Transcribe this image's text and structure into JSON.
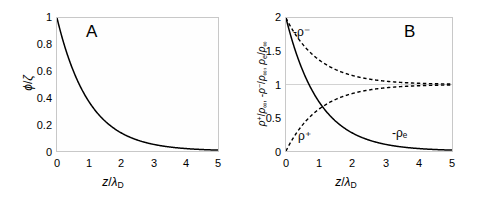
{
  "figure": {
    "panels": [
      {
        "letter": "A",
        "xlabel": "z/λ_D",
        "ylabel": "φ/ζ"
      },
      {
        "letter": "B",
        "xlabel": "z/λ_D",
        "ylabel": "ρ⁺/ρ∞, -ρ⁻/ρ∞, ρₑ/ρ∞"
      }
    ]
  },
  "chart_data": [
    {
      "type": "line",
      "title": "A",
      "xlabel": "z/λ_D",
      "ylabel": "φ/ζ",
      "xlim": [
        0,
        5
      ],
      "ylim": [
        0,
        1
      ],
      "xticks": [
        "0",
        "1",
        "2",
        "3",
        "4",
        "5"
      ],
      "xtick_values": [
        0,
        1,
        2,
        3,
        4,
        5
      ],
      "yticks": [
        "0",
        "0.2",
        "0.4",
        "0.6",
        "0.8",
        "1"
      ],
      "ytick_values": [
        0,
        0.2,
        0.4,
        0.6,
        0.8,
        1
      ],
      "grid": false,
      "legend": "none",
      "series": [
        {
          "name": "φ/ζ",
          "style": "solid",
          "color": "#000000",
          "formula": "exp(-x)",
          "x": [
            0,
            0.25,
            0.5,
            0.75,
            1,
            1.25,
            1.5,
            1.75,
            2,
            2.5,
            3,
            3.5,
            4,
            4.5,
            5
          ],
          "values": [
            1,
            0.779,
            0.607,
            0.472,
            0.368,
            0.287,
            0.223,
            0.174,
            0.135,
            0.082,
            0.05,
            0.03,
            0.018,
            0.011,
            0.007
          ]
        }
      ]
    },
    {
      "type": "line",
      "title": "B",
      "xlabel": "z/λ_D",
      "ylabel": "ρ⁺/ρ∞, -ρ⁻/ρ∞, ρₑ/ρ∞",
      "xlim": [
        0,
        5
      ],
      "ylim": [
        0,
        2
      ],
      "xticks": [
        "0",
        "1",
        "2",
        "3",
        "4",
        "5"
      ],
      "xtick_values": [
        0,
        1,
        2,
        3,
        4,
        5
      ],
      "yticks": [
        "0",
        "0.5",
        "1",
        "1.5",
        "2"
      ],
      "ytick_values": [
        0,
        0.5,
        1,
        1.5,
        2
      ],
      "grid": true,
      "gridlines_y": [
        1
      ],
      "legend": "inline-annotations",
      "series": [
        {
          "name": "-ρ⁻",
          "label": "-ρ⁻",
          "style": "dashed",
          "color": "#000000",
          "formula": "1 + exp(-x)",
          "x": [
            0,
            0.25,
            0.5,
            0.75,
            1,
            1.25,
            1.5,
            1.75,
            2,
            2.5,
            3,
            3.5,
            4,
            4.5,
            5
          ],
          "values": [
            2,
            1.779,
            1.607,
            1.472,
            1.368,
            1.287,
            1.223,
            1.174,
            1.135,
            1.082,
            1.05,
            1.03,
            1.018,
            1.011,
            1.007
          ]
        },
        {
          "name": "ρ⁺",
          "label": "ρ⁺",
          "style": "dashed",
          "color": "#000000",
          "formula": "1 - exp(-x)",
          "x": [
            0,
            0.25,
            0.5,
            0.75,
            1,
            1.25,
            1.5,
            1.75,
            2,
            2.5,
            3,
            3.5,
            4,
            4.5,
            5
          ],
          "values": [
            0,
            0.221,
            0.393,
            0.528,
            0.632,
            0.713,
            0.777,
            0.826,
            0.865,
            0.918,
            0.95,
            0.97,
            0.982,
            0.989,
            0.993
          ]
        },
        {
          "name": "-ρₑ",
          "label": "-ρₑ",
          "style": "solid",
          "color": "#000000",
          "formula": "2*exp(-x)",
          "x": [
            0,
            0.25,
            0.5,
            0.75,
            1,
            1.25,
            1.5,
            1.75,
            2,
            2.5,
            3,
            3.5,
            4,
            4.5,
            5
          ],
          "values": [
            2,
            1.558,
            1.213,
            0.945,
            0.736,
            0.573,
            0.446,
            0.347,
            0.271,
            0.164,
            0.1,
            0.06,
            0.037,
            0.022,
            0.013
          ]
        }
      ]
    }
  ],
  "panel_a": {
    "letter": "A",
    "yticks": [
      {
        "label": "1"
      },
      {
        "label": "0.8"
      },
      {
        "label": "0.6"
      },
      {
        "label": "0.4"
      },
      {
        "label": "0.2"
      },
      {
        "label": "0"
      }
    ],
    "xticks": [
      {
        "label": "0"
      },
      {
        "label": "1"
      },
      {
        "label": "2"
      },
      {
        "label": "3"
      },
      {
        "label": "4"
      },
      {
        "label": "5"
      }
    ]
  },
  "panel_b": {
    "letter": "B",
    "yticks": [
      {
        "label": "2"
      },
      {
        "label": "1.5"
      },
      {
        "label": "1"
      },
      {
        "label": "0.5"
      },
      {
        "label": "0"
      }
    ],
    "xticks": [
      {
        "label": "0"
      },
      {
        "label": "1"
      },
      {
        "label": "2"
      },
      {
        "label": "3"
      },
      {
        "label": "4"
      },
      {
        "label": "5"
      }
    ],
    "annotations": [
      {
        "text": "-ρ⁻"
      },
      {
        "text": "ρ⁺"
      },
      {
        "text": "-ρₑ"
      }
    ]
  },
  "colors": {
    "curve": "#000000",
    "frame": "#c8c8c8",
    "gridline": "#d2d2d2",
    "plot_background": "#fefefe",
    "page_background": "#ffffff"
  }
}
